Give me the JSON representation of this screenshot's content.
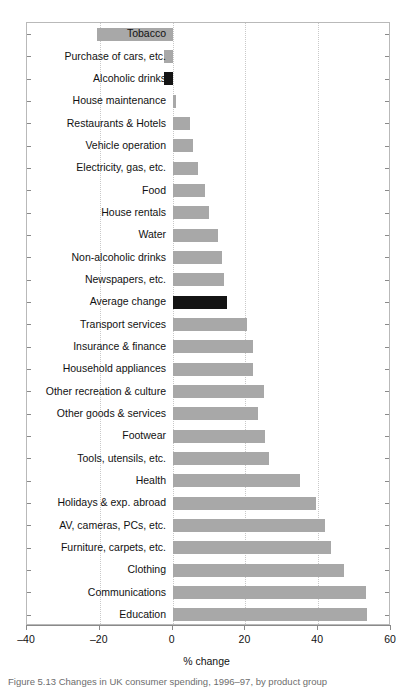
{
  "chart_data": {
    "type": "bar",
    "orientation": "horizontal",
    "title": "",
    "xlabel": "% change",
    "ylabel": "",
    "xlim": [
      -40,
      60
    ],
    "xticks": [
      -40,
      -20,
      0,
      20,
      40,
      60
    ],
    "xtick_labels": [
      "–40",
      "–20",
      "0",
      "20",
      "40",
      "60"
    ],
    "grid": true,
    "grid_axis": "x",
    "legend": "none",
    "bar_color": "#a8a8a8",
    "highlight_color": "#141414",
    "highlight_categories": [
      "Alcoholic drinks",
      "Average change"
    ],
    "categories": [
      "Tobacco",
      "Purchase of cars, etc.",
      "Alcoholic drinks",
      "House maintenance",
      "Restaurants & Hotels",
      "Vehicle operation",
      "Electricity, gas, etc.",
      "Food",
      "House rentals",
      "Water",
      "Non-alcoholic drinks",
      "Newspapers, etc.",
      "Average change",
      "Transport services",
      "Insurance & finance",
      "Household appliances",
      "Other recreation & culture",
      "Other goods & services",
      "Footwear",
      "Tools, utensils, etc.",
      "Health",
      "Holidays & exp. abroad",
      "AV, cameras, PCs, etc.",
      "Furniture, carpets, etc.",
      "Clothing",
      "Communications",
      "Education"
    ],
    "values": [
      -20.8,
      -2.5,
      -2.5,
      0.8,
      4.8,
      5.5,
      7.0,
      9.0,
      10.0,
      12.5,
      13.5,
      14.0,
      15.0,
      20.5,
      22.0,
      22.0,
      25.0,
      23.5,
      25.5,
      26.5,
      35.0,
      39.5,
      42.0,
      43.5,
      47.0,
      53.0,
      53.5
    ]
  },
  "caption": {
    "text": "Figure 5.13  Changes in UK consumer spending, 1996–97, by product group"
  }
}
